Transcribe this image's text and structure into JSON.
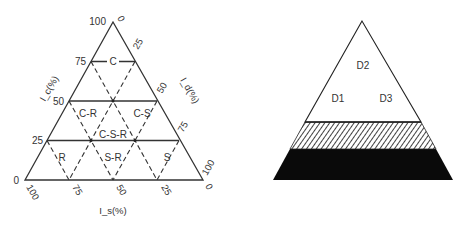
{
  "left_diagram": {
    "axis_labels": {
      "left": "I_c(%)",
      "right": "I_d(%)",
      "bottom": "I_s(%)"
    },
    "left_ticks": [
      "100",
      "75",
      "50",
      "25",
      "0"
    ],
    "right_ticks": [
      "0",
      "25",
      "50",
      "75",
      "100"
    ],
    "bottom_ticks": [
      "100",
      "75",
      "50",
      "25",
      "0"
    ],
    "regions": [
      "C",
      "C-R",
      "C-S",
      "C-S-R",
      "R",
      "S-R",
      "S"
    ]
  },
  "right_diagram": {
    "regions": [
      "D2",
      "D1",
      "D3"
    ],
    "bands": [
      "hatched",
      "solid"
    ]
  }
}
